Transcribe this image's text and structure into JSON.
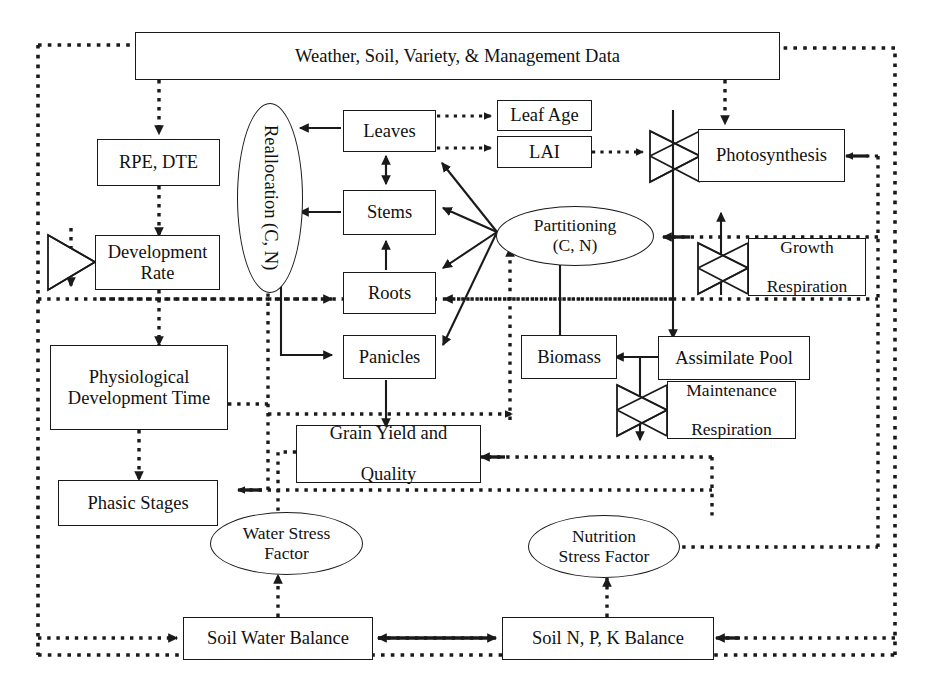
{
  "diagram": {
    "style": {
      "line_color": "#1a1a1a",
      "background": "#ffffff",
      "box_fill": "#ffffff"
    },
    "nodes": {
      "weather": "Weather, Soil, Variety, & Management Data",
      "rpe_dte": "RPE, DTE",
      "development_rate": "Development Rate",
      "physiological_development_time": "Physiological Development Time",
      "phasic_stages": "Phasic Stages",
      "reallocation": "Reallocation (C, N)",
      "reallocation_line1": "Reallocation",
      "reallocation_line2": "(C, N)",
      "leaves": "Leaves",
      "stems": "Stems",
      "roots": "Roots",
      "panicles": "Panicles",
      "leaf_age": "Leaf Age",
      "lai": "LAI",
      "photosynthesis": "Photosynthesis",
      "partitioning_line1": "Partitioning",
      "partitioning_line2": "(C, N)",
      "growth_respiration_line1": "Growth",
      "growth_respiration_line2": "Respiration",
      "maintenance_respiration_line1": "Maintenance",
      "maintenance_respiration_line2": "Respiration",
      "biomass": "Biomass",
      "assimilate_pool": "Assimilate Pool",
      "grain_yield_line1": "Grain Yield and",
      "grain_yield_line2": "Quality",
      "water_stress_line1": "Water Stress",
      "water_stress_line2": "Factor",
      "nutrition_stress_line1": "Nutrition",
      "nutrition_stress_line2": "Stress Factor",
      "soil_water_balance": "Soil Water Balance",
      "soil_npk_balance": "Soil N, P, K Balance"
    }
  }
}
